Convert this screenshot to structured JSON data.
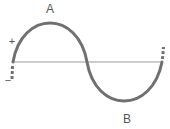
{
  "diagram": {
    "type": "sine-wave",
    "labels": {
      "peak": "A",
      "trough": "B",
      "positive": "+",
      "negative": "−"
    },
    "colors": {
      "curve": "#707070",
      "baseline": "#9a9a9a",
      "text": "#555555",
      "background": "#ffffff"
    }
  }
}
